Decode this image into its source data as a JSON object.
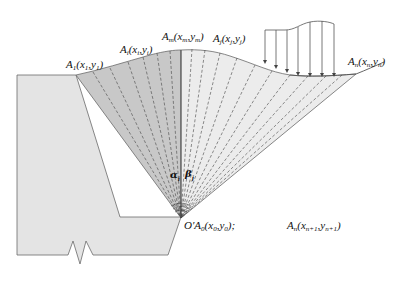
{
  "diagram": {
    "type": "slope-stability-fan-slices",
    "colors": {
      "background": "#ffffff",
      "wall_fill": "#e4e4e4",
      "left_fan_fill": "#c8c8c8",
      "right_fan_fill": "#ececec",
      "stroke": "#555555",
      "dash": "#444444"
    },
    "labels": {
      "a1": {
        "base": "A",
        "sub": "1",
        "coords": "(x",
        "x_sub": "1",
        "sep": ",y",
        "y_sub": "1",
        "close": ")"
      },
      "ai": {
        "base": "A",
        "sub": "i",
        "coords": "(x",
        "x_sub": "i",
        "sep": ",y",
        "y_sub": "i",
        "close": ")"
      },
      "am": {
        "base": "A",
        "sub": "m",
        "coords": "(x",
        "x_sub": "m",
        "sep": ",y",
        "y_sub": "m",
        "close": ")"
      },
      "aj": {
        "base": "A",
        "sub": "j",
        "coords": "(x",
        "x_sub": "j",
        "sep": ",y",
        "y_sub": "j",
        "close": ")"
      },
      "an": {
        "base": "A",
        "sub": "n",
        "coords": "(x",
        "x_sub": "n",
        "sep": ",y",
        "y_sub": "n",
        "close": ")"
      },
      "origin": {
        "prefix": "O′A",
        "sub": "0",
        "coords": "(x",
        "x_sub": "0",
        "sep": ",y",
        "y_sub": "0",
        "close": ");"
      },
      "an1": {
        "base": "A",
        "sub": "n",
        "coords": "(x",
        "x_sub": "n+1",
        "sep": ",y",
        "y_sub": "n+1",
        "close": ")"
      },
      "alpha": "α",
      "alpha_sub": "i",
      "beta": "β",
      "beta_sub": "j"
    },
    "load": {
      "arrow_count": 7
    }
  }
}
